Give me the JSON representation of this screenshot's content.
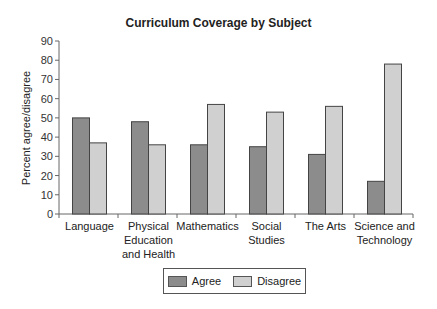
{
  "chart_data": {
    "type": "bar",
    "title": "Curriculum Coverage by Subject",
    "xlabel": "",
    "ylabel": "Percent agree/disagree",
    "ylim": [
      0,
      90
    ],
    "yticks": [
      0,
      10,
      20,
      30,
      40,
      50,
      60,
      70,
      80,
      90
    ],
    "grid": false,
    "legend_position": "bottom",
    "categories": [
      "Language",
      "Physical Education and Health",
      "Mathematics",
      "Social Studies",
      "The Arts",
      "Science and Technology"
    ],
    "category_labels": [
      [
        "Language"
      ],
      [
        "Physical",
        "Education",
        "and Health"
      ],
      [
        "Mathematics"
      ],
      [
        "Social",
        "Studies"
      ],
      [
        "The Arts"
      ],
      [
        "Science and",
        "Technology"
      ]
    ],
    "series": [
      {
        "name": "Agree",
        "color": "#8c8c8c",
        "values": [
          50,
          48,
          36,
          35,
          31,
          17
        ]
      },
      {
        "name": "Disagree",
        "color": "#d0d0d0",
        "values": [
          37,
          36,
          57,
          53,
          56,
          78
        ]
      }
    ]
  }
}
